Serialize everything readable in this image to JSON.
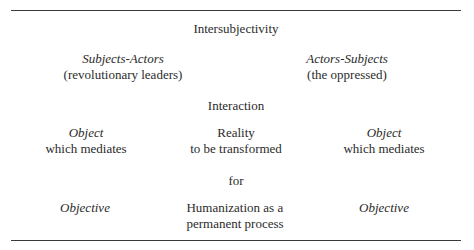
{
  "diagram": {
    "title": "Intersubjectivity",
    "actors": {
      "left": {
        "role": "Subjects-Actors",
        "group": "(revolutionary leaders)"
      },
      "right": {
        "role": "Actors-Subjects",
        "group": "(the oppressed)"
      }
    },
    "relation": "Interaction",
    "mediation": {
      "left": {
        "label": "Object",
        "sub": "which mediates"
      },
      "center": {
        "label": "Reality",
        "sub": "to be transformed"
      },
      "right": {
        "label": "Object",
        "sub": "which mediates"
      }
    },
    "connector": "for",
    "goals": {
      "left": {
        "label": "Objective"
      },
      "center": {
        "line1": "Humanization as a",
        "line2": "permanent process"
      },
      "right": {
        "label": "Objective"
      }
    }
  }
}
